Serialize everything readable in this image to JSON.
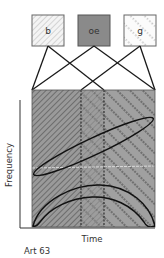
{
  "diagram": {
    "sources": [
      {
        "id": "b",
        "label": "b",
        "fill": "pattern:hatch",
        "x": 32,
        "y": 15,
        "w": 32,
        "h": 31
      },
      {
        "id": "oe",
        "label": "oe",
        "fill": "#8a8a8a",
        "x": 78,
        "y": 15,
        "w": 32,
        "h": 31
      },
      {
        "id": "g",
        "label": "g",
        "fill": "pattern:dots",
        "x": 124,
        "y": 15,
        "w": 32,
        "h": 31
      }
    ],
    "plot": {
      "x_label": "Time",
      "y_label": "Frequency",
      "regions": [
        {
          "name": "b-region",
          "x_start": 32,
          "x_end": 104,
          "pattern": "hatch"
        },
        {
          "name": "oe-region",
          "x_start": 81,
          "x_end": 104,
          "pattern": "hatch+dots",
          "outline": "dotted"
        },
        {
          "name": "g-region",
          "x_start": 81,
          "x_end": 155,
          "pattern": "dots"
        }
      ],
      "shapes": [
        {
          "name": "rising-ellipse",
          "description": "diagonal elongated ellipse rising left to right"
        },
        {
          "name": "arch-crescent",
          "description": "arched crescent band along the bottom"
        }
      ]
    },
    "caption": "Art 63",
    "colors": {
      "background": "#ffffff",
      "plot_fill": "#9a9a9a",
      "oe_fill": "#8a8a8a",
      "stroke": "#1a1a1a",
      "text": "#333333"
    }
  }
}
